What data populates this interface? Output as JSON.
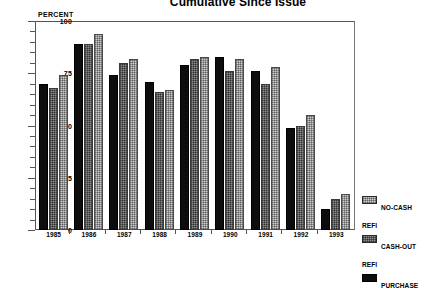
{
  "chart_data": {
    "type": "bar",
    "title": "Cumulative Since Issue",
    "ylabel": "PERCENT",
    "xlabel": "",
    "ylim": [
      0,
      100
    ],
    "yticks": [
      0,
      25,
      50,
      75,
      100
    ],
    "ytick_labels": [
      "0",
      "25",
      "50",
      "75",
      "100"
    ],
    "grid": false,
    "legend_position": "right-bottom",
    "categories": [
      "1985",
      "1986",
      "1987",
      "1988",
      "1989",
      "1990",
      "1991",
      "1992",
      "1993"
    ],
    "series": [
      {
        "name": "PURCHASE",
        "key": "purchase",
        "color": "#0d0d0d",
        "values": [
          70,
          89,
          74,
          71,
          79,
          83,
          76,
          49,
          10
        ]
      },
      {
        "name": "CASH-OUT\nREFI",
        "key": "cashout",
        "color": "#8f8f8f",
        "values": [
          68,
          89,
          80,
          66,
          82,
          76,
          70,
          50,
          15
        ]
      },
      {
        "name": "NO-CASH\nREFI",
        "key": "nocash",
        "color": "#cfcfcf",
        "values": [
          74,
          94,
          82,
          67,
          83,
          82,
          78,
          55,
          17
        ]
      }
    ],
    "legend_order": [
      "NO-CASH\nREFI",
      "CASH-OUT\nREFI",
      "PURCHASE"
    ]
  }
}
